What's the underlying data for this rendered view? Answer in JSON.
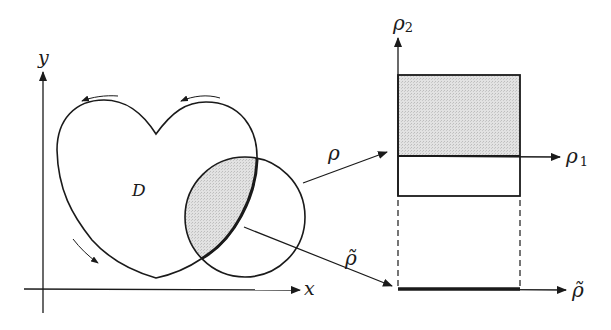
{
  "diagram": {
    "left_panel": {
      "x_axis_label": "x",
      "y_axis_label": "y",
      "region_label": "D",
      "shapes": [
        "heart-shaped region D",
        "circle intersecting D",
        "shaded lens intersection"
      ],
      "orientation_arrows": 3
    },
    "maps": [
      {
        "label": "ρ",
        "description": "maps circle region to rectangle"
      },
      {
        "label": "ρ̃",
        "description": "maps to line segment"
      }
    ],
    "right_panel": {
      "vertical_axis_label": "ρ",
      "vertical_axis_subscript": "2",
      "horizontal_axis_label": "ρ",
      "horizontal_axis_subscript": "1",
      "bottom_axis_label": "ρ̃"
    },
    "colors": {
      "stroke": "#1a1a1a",
      "shade": "#d9d9d9",
      "background": "#ffffff"
    }
  }
}
